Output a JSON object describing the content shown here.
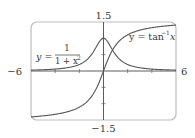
{
  "chart_data": {
    "type": "line",
    "title": "",
    "xlabel": "",
    "ylabel": "",
    "xlim": [
      -6,
      6
    ],
    "ylim": [
      -1.5,
      1.5
    ],
    "grid": false,
    "legend": "none (inline curve labels)",
    "axis_labels": {
      "x_min": "−6",
      "x_max": "6",
      "y_max": "1.5",
      "y_min": "−1.5"
    },
    "x_ticks_every": 2,
    "y_ticks_every": 0.5,
    "series": [
      {
        "name": "y = 1/(1 + x^2)",
        "label_parts": {
          "lhs": "y =",
          "num": "1",
          "den": "1 + x",
          "den_exp": "2"
        },
        "x": [
          -6,
          -5,
          -4,
          -3,
          -2,
          -1.5,
          -1,
          -0.5,
          0,
          0.5,
          1,
          1.5,
          2,
          3,
          4,
          5,
          6
        ],
        "values": [
          0.027,
          0.038,
          0.059,
          0.1,
          0.2,
          0.308,
          0.5,
          0.8,
          1.0,
          0.8,
          0.5,
          0.308,
          0.2,
          0.1,
          0.059,
          0.038,
          0.027
        ]
      },
      {
        "name": "y = tan^-1 x",
        "label_parts": {
          "lhs": "y = tan",
          "exp": "−1",
          "var": "x"
        },
        "x": [
          -6,
          -5,
          -4,
          -3,
          -2,
          -1.5,
          -1,
          -0.5,
          0,
          0.5,
          1,
          1.5,
          2,
          3,
          4,
          5,
          6
        ],
        "values": [
          -1.406,
          -1.373,
          -1.326,
          -1.249,
          -1.107,
          -0.983,
          -0.785,
          -0.464,
          0.0,
          0.464,
          0.785,
          0.983,
          1.107,
          1.249,
          1.326,
          1.373,
          1.406
        ]
      }
    ]
  }
}
